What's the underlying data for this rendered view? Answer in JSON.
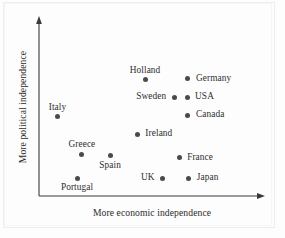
{
  "figure": {
    "background_color": "#fdfdfd",
    "frame_color": "#ededed",
    "axis_color": "#3a3a3a",
    "marker_color": "#4a4a4a",
    "text_color": "#2e2e2e"
  },
  "chart_data": {
    "type": "scatter",
    "title": "",
    "subtitle": "",
    "xlabel": "More economic independence",
    "ylabel": "More political independence",
    "xlim": [
      0,
      100
    ],
    "ylim": [
      0,
      100
    ],
    "grid": false,
    "legend": "none",
    "axis_ticks": "none",
    "axis_style": "arrow",
    "annotations": [],
    "points": [
      {
        "label": "Holland",
        "x": 48.2,
        "y": 66.9,
        "label_position": "above"
      },
      {
        "label": "Germany",
        "x": 67.7,
        "y": 67.4,
        "label_position": "right"
      },
      {
        "label": "Sweden",
        "x": 61.5,
        "y": 56.7,
        "label_position": "left"
      },
      {
        "label": "USA",
        "x": 67.3,
        "y": 56.7,
        "label_position": "right"
      },
      {
        "label": "Canada",
        "x": 67.7,
        "y": 46.5,
        "label_position": "right"
      },
      {
        "label": "Italy",
        "x": 8.4,
        "y": 45.5,
        "label_position": "above"
      },
      {
        "label": "Ireland",
        "x": 44.7,
        "y": 35.4,
        "label_position": "right"
      },
      {
        "label": "Greece",
        "x": 19.5,
        "y": 24.1,
        "label_position": "above"
      },
      {
        "label": "Spain",
        "x": 32.3,
        "y": 23.0,
        "label_position": "below"
      },
      {
        "label": "France",
        "x": 63.7,
        "y": 21.9,
        "label_position": "right"
      },
      {
        "label": "Portugal",
        "x": 17.3,
        "y": 10.2,
        "label_position": "below"
      },
      {
        "label": "UK",
        "x": 56.2,
        "y": 10.2,
        "label_position": "left"
      },
      {
        "label": "Japan",
        "x": 68.1,
        "y": 10.2,
        "label_position": "right"
      }
    ]
  }
}
